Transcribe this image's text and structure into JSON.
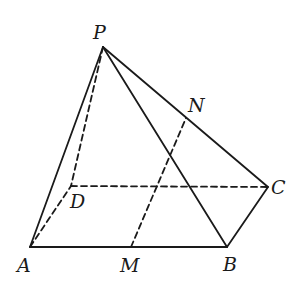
{
  "diagram": {
    "type": "pyramid",
    "stroke_color": "#1a1a1a",
    "points": {
      "P": {
        "label": "P",
        "x": 103,
        "y": 47,
        "label_x": 93,
        "label_y": 39
      },
      "A": {
        "label": "A",
        "x": 30,
        "y": 247,
        "label_x": 17,
        "label_y": 272
      },
      "B": {
        "label": "B",
        "x": 227,
        "y": 247,
        "label_x": 223,
        "label_y": 271
      },
      "C": {
        "label": "C",
        "x": 268,
        "y": 187,
        "label_x": 271,
        "label_y": 194
      },
      "D": {
        "label": "D",
        "x": 71,
        "y": 186,
        "label_x": 70,
        "label_y": 208
      },
      "M": {
        "label": "M",
        "x": 131,
        "y": 247,
        "label_x": 120,
        "label_y": 272
      },
      "N": {
        "label": "N",
        "x": 186,
        "y": 118,
        "label_x": 188,
        "label_y": 112
      }
    },
    "edges": [
      {
        "from": "P",
        "to": "A",
        "style": "solid"
      },
      {
        "from": "P",
        "to": "B",
        "style": "solid"
      },
      {
        "from": "P",
        "to": "C",
        "style": "solid"
      },
      {
        "from": "A",
        "to": "B",
        "style": "solid"
      },
      {
        "from": "B",
        "to": "C",
        "style": "solid"
      },
      {
        "from": "P",
        "to": "D",
        "style": "dashed"
      },
      {
        "from": "A",
        "to": "D",
        "style": "dashed"
      },
      {
        "from": "D",
        "to": "C",
        "style": "dashed"
      },
      {
        "from": "M",
        "to": "N",
        "style": "dashed"
      }
    ]
  }
}
